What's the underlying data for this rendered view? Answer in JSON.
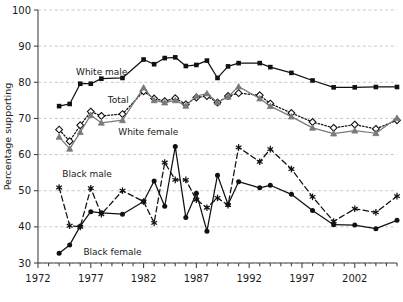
{
  "chart_data": {
    "type": "line",
    "title": "",
    "subtitle": "",
    "xlabel": "",
    "ylabel": "Percentage supporting",
    "xlim": [
      1972,
      2006
    ],
    "ylim": [
      30,
      100
    ],
    "ytick_values": [
      30,
      40,
      50,
      60,
      70,
      80,
      90,
      100
    ],
    "ytick_labels": [
      "30",
      "40",
      "50",
      "60",
      "70",
      "80",
      "90",
      "100"
    ],
    "xtick_values": [
      1972,
      1977,
      1982,
      1987,
      1992,
      1997,
      2002
    ],
    "xtick_labels": [
      "1972",
      "1977",
      "1982",
      "1987",
      "1992",
      "1997",
      "2002"
    ],
    "xtick_minor_step": 1,
    "grid": "horizontal-dashed",
    "legend": "inline-annotations",
    "series": [
      {
        "name": "White male",
        "marker": "filled-square",
        "line": "solid",
        "color": "#111111",
        "x": [
          1974,
          1975,
          1976,
          1977,
          1978,
          1980,
          1982,
          1983,
          1984,
          1985,
          1986,
          1987,
          1988,
          1989,
          1990,
          1991,
          1993,
          1994,
          1996,
          1998,
          2000,
          2002,
          2004,
          2006
        ],
        "y": [
          73.4,
          74.0,
          79.6,
          79.6,
          81.0,
          81.2,
          86.3,
          85.0,
          86.7,
          86.9,
          84.5,
          84.8,
          86.0,
          81.2,
          84.4,
          85.3,
          85.3,
          84.2,
          82.6,
          80.5,
          78.6,
          78.6,
          78.7,
          78.7
        ]
      },
      {
        "name": "Total",
        "marker": "open-diamond",
        "line": "dotted",
        "color": "#111111",
        "x": [
          1974,
          1975,
          1976,
          1977,
          1978,
          1980,
          1982,
          1983,
          1984,
          1985,
          1986,
          1987,
          1988,
          1989,
          1990,
          1991,
          1993,
          1994,
          1996,
          1998,
          2000,
          2002,
          2004,
          2006
        ],
        "y": [
          66.9,
          63.7,
          68.1,
          71.9,
          70.7,
          71.2,
          77.5,
          75.5,
          74.8,
          75.6,
          73.9,
          75.8,
          76.2,
          74.4,
          76.2,
          77.0,
          76.4,
          74.1,
          71.5,
          69.0,
          67.4,
          68.3,
          67.1,
          69.5
        ]
      },
      {
        "name": "White female",
        "marker": "gray-triangle",
        "line": "solid",
        "color": "#7a7a7a",
        "x": [
          1974,
          1975,
          1976,
          1977,
          1978,
          1980,
          1982,
          1983,
          1984,
          1985,
          1986,
          1987,
          1988,
          1989,
          1990,
          1991,
          1993,
          1994,
          1996,
          1998,
          2000,
          2002,
          2004,
          2006
        ],
        "y": [
          64.9,
          61.6,
          66.2,
          70.9,
          68.8,
          69.5,
          78.5,
          75.0,
          74.4,
          75.0,
          73.5,
          76.2,
          76.9,
          74.4,
          76.0,
          78.8,
          75.5,
          73.4,
          70.5,
          67.4,
          65.8,
          66.6,
          65.9,
          70.1
        ]
      },
      {
        "name": "Black male",
        "marker": "asterisk",
        "line": "dashed",
        "color": "#111111",
        "x": [
          1974,
          1975,
          1976,
          1977,
          1978,
          1980,
          1982,
          1983,
          1984,
          1985,
          1986,
          1987,
          1988,
          1989,
          1990,
          1991,
          1993,
          1994,
          1996,
          1998,
          2000,
          2002,
          2004,
          2006
        ],
        "y": [
          50.9,
          40.3,
          40.0,
          50.7,
          43.5,
          50.0,
          47.0,
          41.1,
          57.8,
          53.0,
          53.0,
          47.5,
          45.3,
          48.0,
          46.0,
          62.0,
          58.0,
          61.5,
          56.0,
          48.3,
          41.5,
          45.0,
          44.0,
          48.5
        ]
      },
      {
        "name": "Black female",
        "marker": "filled-circle",
        "line": "solid",
        "color": "#111111",
        "x": [
          1974,
          1975,
          1976,
          1977,
          1978,
          1980,
          1982,
          1983,
          1984,
          1985,
          1986,
          1987,
          1988,
          1989,
          1990,
          1991,
          1993,
          1994,
          1996,
          1998,
          2000,
          2002,
          2004,
          2006
        ],
        "y": [
          32.7,
          35.0,
          40.2,
          44.2,
          43.9,
          43.5,
          47.0,
          52.7,
          45.7,
          62.2,
          42.6,
          49.3,
          38.8,
          54.3,
          46.2,
          52.5,
          50.8,
          51.5,
          49.0,
          44.5,
          40.6,
          40.5,
          39.5,
          41.8
        ]
      }
    ],
    "annotations": [
      {
        "text": "White male",
        "x": 1975.6,
        "y": 81.9
      },
      {
        "text": "Total",
        "x": 1978.6,
        "y": 74.3
      },
      {
        "text": "White female",
        "x": 1979.6,
        "y": 65.3
      },
      {
        "text": "Black male",
        "x": 1974.3,
        "y": 53.8
      },
      {
        "text": "Black female",
        "x": 1976.3,
        "y": 32.2
      }
    ]
  }
}
